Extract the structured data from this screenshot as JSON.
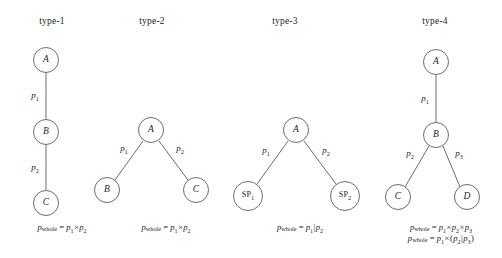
{
  "figure": {
    "background_color": "#ffffff",
    "stroke_color": "#6d6d6d",
    "text_color": "#1d1d1d"
  },
  "panels": [
    {
      "id": "type-1",
      "title": "type-1",
      "title_x": 52,
      "title_y": 16,
      "nodes": [
        {
          "id": "A",
          "label": "A",
          "kind": "plain",
          "cx": 46,
          "cy": 60,
          "r": 13
        },
        {
          "id": "B",
          "label": "B",
          "kind": "plain",
          "cx": 46,
          "cy": 132,
          "r": 13
        },
        {
          "id": "C",
          "label": "C",
          "kind": "plain",
          "cx": 46,
          "cy": 203,
          "r": 13
        }
      ],
      "edges": [
        {
          "from": "A",
          "to": "B",
          "x1": 46,
          "y1": 73,
          "x2": 46,
          "y2": 119
        },
        {
          "from": "B",
          "to": "C",
          "x1": 46,
          "y1": 145,
          "x2": 46,
          "y2": 190
        }
      ],
      "edge_labels": [
        {
          "text": "p",
          "sub": "1",
          "x": 35,
          "y": 97
        },
        {
          "text": "p",
          "sub": "2",
          "x": 35,
          "y": 169
        }
      ],
      "formulas": [
        {
          "lhs": "p",
          "lhs_sub": "whole",
          "rhs_parts": [
            {
              "type": "var",
              "text": "p",
              "sub": "1"
            },
            {
              "type": "op",
              "text": "×"
            },
            {
              "type": "var",
              "text": "p",
              "sub": "2"
            }
          ],
          "x": 62,
          "y": 222
        }
      ]
    },
    {
      "id": "type-2",
      "title": "type-2",
      "title_x": 152,
      "title_y": 16,
      "nodes": [
        {
          "id": "A",
          "label": "A",
          "kind": "plain",
          "cx": 151,
          "cy": 130,
          "r": 13
        },
        {
          "id": "B",
          "label": "B",
          "kind": "plain",
          "cx": 107,
          "cy": 190,
          "r": 13
        },
        {
          "id": "C",
          "label": "C",
          "kind": "plain",
          "cx": 196,
          "cy": 190,
          "r": 13
        }
      ],
      "edges": [
        {
          "from": "A",
          "to": "B",
          "x1": 143,
          "y1": 141,
          "x2": 115,
          "y2": 180
        },
        {
          "from": "A",
          "to": "C",
          "x1": 159,
          "y1": 141,
          "x2": 188,
          "y2": 180
        }
      ],
      "edge_labels": [
        {
          "text": "p",
          "sub": "1",
          "x": 124,
          "y": 150
        },
        {
          "text": "p",
          "sub": "2",
          "x": 180,
          "y": 150
        }
      ],
      "formulas": [
        {
          "lhs": "p",
          "lhs_sub": "whole",
          "rhs_parts": [
            {
              "type": "var",
              "text": "p",
              "sub": "1"
            },
            {
              "type": "op",
              "text": "×"
            },
            {
              "type": "var",
              "text": "p",
              "sub": "2"
            }
          ],
          "x": 166,
          "y": 222
        }
      ]
    },
    {
      "id": "type-3",
      "title": "type-3",
      "title_x": 285,
      "title_y": 16,
      "nodes": [
        {
          "id": "A",
          "label": "A",
          "kind": "plain",
          "cx": 296,
          "cy": 130,
          "r": 13
        },
        {
          "id": "SP1",
          "label": "SP",
          "sub": "1",
          "kind": "sp",
          "cx": 248,
          "cy": 196,
          "r": 15
        },
        {
          "id": "SP2",
          "label": "SP",
          "sub": "2",
          "kind": "sp",
          "cx": 345,
          "cy": 196,
          "r": 15
        }
      ],
      "edges": [
        {
          "from": "A",
          "to": "SP1",
          "x1": 288,
          "y1": 141,
          "x2": 257,
          "y2": 184
        },
        {
          "from": "A",
          "to": "SP2",
          "x1": 304,
          "y1": 141,
          "x2": 336,
          "y2": 184
        }
      ],
      "edge_labels": [
        {
          "text": "p",
          "sub": "1",
          "x": 266,
          "y": 152
        },
        {
          "text": "p",
          "sub": "2",
          "x": 326,
          "y": 152
        }
      ],
      "formulas": [
        {
          "lhs": "p",
          "lhs_sub": "whole",
          "rhs_parts": [
            {
              "type": "var",
              "text": "p",
              "sub": "1"
            },
            {
              "type": "op",
              "text": "|"
            },
            {
              "type": "var",
              "text": "p",
              "sub": "2"
            }
          ],
          "x": 300,
          "y": 222
        }
      ]
    },
    {
      "id": "type-4",
      "title": "type-4",
      "title_x": 435,
      "title_y": 16,
      "nodes": [
        {
          "id": "A",
          "label": "A",
          "kind": "plain",
          "cx": 436,
          "cy": 62,
          "r": 13
        },
        {
          "id": "B",
          "label": "B",
          "kind": "plain",
          "cx": 436,
          "cy": 135,
          "r": 13
        },
        {
          "id": "C",
          "label": "C",
          "kind": "plain",
          "cx": 398,
          "cy": 197,
          "r": 13
        },
        {
          "id": "D",
          "label": "D",
          "kind": "plain",
          "cx": 467,
          "cy": 197,
          "r": 13
        }
      ],
      "edges": [
        {
          "from": "A",
          "to": "B",
          "x1": 436,
          "y1": 75,
          "x2": 436,
          "y2": 122
        },
        {
          "from": "B",
          "to": "C",
          "x1": 429,
          "y1": 146,
          "x2": 405,
          "y2": 187
        },
        {
          "from": "B",
          "to": "D",
          "x1": 443,
          "y1": 146,
          "x2": 460,
          "y2": 187
        }
      ],
      "edge_labels": [
        {
          "text": "p",
          "sub": "1",
          "x": 425,
          "y": 100
        },
        {
          "text": "p",
          "sub": "2",
          "x": 410,
          "y": 155
        },
        {
          "text": "p",
          "sub": "3",
          "x": 459,
          "y": 155
        }
      ],
      "formulas": [
        {
          "lhs": "p",
          "lhs_sub": "whole",
          "rhs_parts": [
            {
              "type": "var",
              "text": "p",
              "sub": "1"
            },
            {
              "type": "op",
              "text": "×"
            },
            {
              "type": "var",
              "text": "p",
              "sub": "2"
            },
            {
              "type": "op",
              "text": "×"
            },
            {
              "type": "var",
              "text": "p",
              "sub": "3"
            }
          ],
          "x": 441,
          "y": 222
        },
        {
          "lhs": "p",
          "lhs_sub": "whole",
          "rhs_parts": [
            {
              "type": "var",
              "text": "p",
              "sub": "1"
            },
            {
              "type": "op",
              "text": "×"
            },
            {
              "type": "op",
              "text": "("
            },
            {
              "type": "var",
              "text": "p",
              "sub": "2"
            },
            {
              "type": "op",
              "text": "|"
            },
            {
              "type": "var",
              "text": "p",
              "sub": "3"
            },
            {
              "type": "op",
              "text": ")"
            }
          ],
          "x": 441,
          "y": 233
        }
      ]
    }
  ]
}
